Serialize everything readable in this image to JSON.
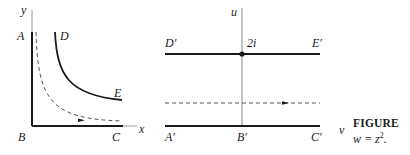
{
  "figure": {
    "left_panel": {
      "axis_labels": {
        "x": "x",
        "y": "y"
      },
      "points": {
        "A": "A",
        "B": "B",
        "C": "C",
        "D": "D",
        "E": "E"
      }
    },
    "right_panel": {
      "axis_labels": {
        "u": "u",
        "v": "v"
      },
      "points": {
        "A": "A′",
        "B": "B′",
        "C": "C′",
        "D": "D′",
        "E": "E′"
      },
      "marked_value": "2i"
    },
    "caption": {
      "title": "FIGURE",
      "equation_lhs": "w = z",
      "equation_exponent": "2",
      "equation_tail": "."
    },
    "colors": {
      "ink": "#1a1a1a",
      "dashed": "#555555"
    }
  }
}
